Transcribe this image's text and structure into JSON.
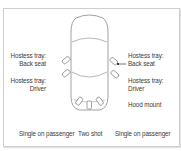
{
  "diagram": {
    "labels": {
      "left_back": [
        "Hostess tray:",
        "Back seat"
      ],
      "left_driver": [
        "Hostess tray:",
        "Driver"
      ],
      "right_back": [
        "Hostess tray:",
        "Back seat"
      ],
      "right_driver": [
        "Hostess tray:",
        "Driver"
      ],
      "hood_mount": "Hood mount",
      "bottom_left": "Single on passenger",
      "bottom_center": "Two shot",
      "bottom_right": "Single on passenger"
    },
    "colors": {
      "line": "#8a8a8a",
      "frame": "#cfcfcf",
      "text": "#3a3a3a",
      "pointer": "#111111"
    }
  }
}
